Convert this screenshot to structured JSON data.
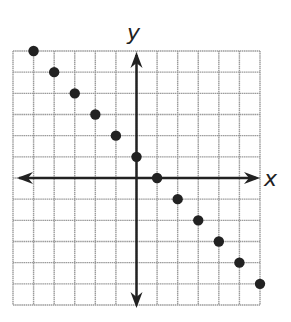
{
  "chart_data": {
    "type": "scatter",
    "title": "",
    "xlabel": "x",
    "ylabel": "y",
    "xlim": [
      -6,
      6
    ],
    "ylim": [
      -6,
      6
    ],
    "grid": true,
    "grid_step": 1,
    "tick_labels": false,
    "axes_arrows": true,
    "series": [
      {
        "name": "points",
        "x": [
          -5,
          -4,
          -3,
          -2,
          -1,
          0,
          1,
          2,
          3,
          4,
          5,
          6
        ],
        "y": [
          6,
          5,
          4,
          3,
          2,
          1,
          0,
          -1,
          -2,
          -3,
          -4,
          -5
        ]
      }
    ]
  },
  "colors": {
    "grid": "#9a9a9a",
    "axis": "#222222",
    "point": "#222222",
    "background": "#ffffff"
  }
}
